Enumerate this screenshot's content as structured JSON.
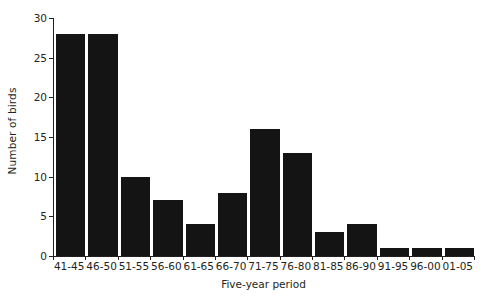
{
  "chart_data": {
    "type": "bar",
    "title": "",
    "xlabel": "Five-year period",
    "ylabel": "Number of birds",
    "categories": [
      "41-45",
      "46-50",
      "51-55",
      "56-60",
      "61-65",
      "66-70",
      "71-75",
      "76-80",
      "81-85",
      "86-90",
      "91-95",
      "96-00",
      "01-05"
    ],
    "values": [
      28,
      28,
      10,
      7,
      4,
      8,
      16,
      13,
      3,
      4,
      1,
      1,
      1
    ],
    "ylim": [
      0,
      30
    ],
    "yticks": [
      0,
      5,
      10,
      15,
      20,
      25,
      30
    ],
    "ytick_labels": [
      "0",
      "5",
      "10",
      "15",
      "20",
      "25",
      "30"
    ],
    "grid": false,
    "legend": "none",
    "bar_color": "#141414",
    "axis_color": "#231f20"
  }
}
